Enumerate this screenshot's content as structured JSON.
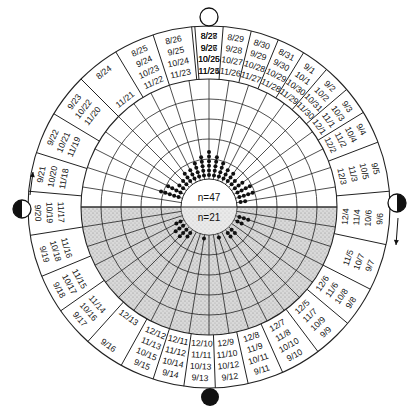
{
  "diagram": {
    "center": {
      "x": 209,
      "y": 207
    },
    "radii": {
      "outer": 181,
      "label_inner": 128,
      "grid": [
        108,
        88,
        68,
        48
      ],
      "core": 28
    },
    "colors": {
      "line": "#222222",
      "shade": "#cfcfcf",
      "dot": "#111111",
      "background": "#ffffff"
    },
    "core_labels": {
      "upper": "n=47",
      "lower": "n=21"
    },
    "moon_symbols": [
      {
        "name": "full-moon-icon",
        "phase": "full",
        "x": 209,
        "y": 17
      },
      {
        "name": "new-moon-icon",
        "phase": "new",
        "x": 210,
        "y": 397
      },
      {
        "name": "first-quarter-moon-icon",
        "phase": "half-right-dark",
        "x": 397,
        "y": 203
      },
      {
        "name": "last-quarter-moon-icon",
        "phase": "half-left-dark",
        "x": 22,
        "y": 209
      }
    ],
    "arrows": [
      {
        "name": "arrow-up-left",
        "x1": 30,
        "y1": 195,
        "x2": 33,
        "y2": 172
      },
      {
        "name": "arrow-down-right",
        "x1": 398,
        "y1": 218,
        "x2": 396,
        "y2": 245
      }
    ],
    "sectors": [
      {
        "angle": -90,
        "lines": [
          "8/28",
          "9/27",
          "10/26",
          "11/25"
        ]
      },
      {
        "angle": -81,
        "lines": [
          "8/29",
          "9/28",
          "10/27",
          "11/26"
        ]
      },
      {
        "angle": -72,
        "lines": [
          "8/30",
          "9/29",
          "10/28",
          "11/27"
        ]
      },
      {
        "angle": -63,
        "lines": [
          "8/31",
          "9/30",
          "10/29",
          "11/28"
        ]
      },
      {
        "angle": -54,
        "lines": [
          "9/1",
          "10/1",
          "10/30",
          "11/29"
        ]
      },
      {
        "angle": -45,
        "lines": [
          "9/2",
          "10/2",
          "10/31",
          "11/30"
        ]
      },
      {
        "angle": -36,
        "lines": [
          "9/3",
          "10/3",
          "11/1",
          "12/1"
        ]
      },
      {
        "angle": -27,
        "lines": [
          "9/4",
          "10/4",
          "11/2",
          "12/2"
        ]
      },
      {
        "angle": -13,
        "lines": [
          "9/5",
          "10/5",
          "11/3",
          "12/3"
        ]
      },
      {
        "angle": 4,
        "lines": [
          "9/6",
          "10/6",
          "11/4",
          "12/4"
        ]
      },
      {
        "angle": 20,
        "lines": [
          "9/7",
          "10/7",
          "11/5"
        ]
      },
      {
        "angle": 34,
        "lines": [
          "9/8",
          "10/8",
          "11/6",
          "12/6"
        ]
      },
      {
        "angle": 47,
        "lines": [
          "9/9",
          "10/9",
          "11/7",
          "12/5"
        ]
      },
      {
        "angle": 60,
        "lines": [
          "9/10",
          "10/10",
          "11/8",
          "12/7"
        ]
      },
      {
        "angle": 72,
        "lines": [
          "9/11",
          "10/11",
          "11/9",
          "12/8"
        ]
      },
      {
        "angle": 83,
        "lines": [
          "9/12",
          "10/12",
          "11/10",
          "12/9"
        ]
      },
      {
        "angle": 93,
        "lines": [
          "9/13",
          "10/13",
          "11/11",
          "12/10"
        ]
      },
      {
        "angle": 103,
        "lines": [
          "9/14",
          "10/14",
          "11/12",
          "12/11"
        ]
      },
      {
        "angle": 113,
        "lines": [
          "9/15",
          "10/15",
          "11/13",
          "12/12"
        ]
      },
      {
        "angle": 126,
        "lines": [
          "9/16",
          "",
          "",
          "12/13"
        ]
      },
      {
        "angle": 139,
        "lines": [
          "9/17",
          "10/16",
          "11/14"
        ]
      },
      {
        "angle": 151,
        "lines": [
          "9/18",
          "10/17",
          "11/15"
        ]
      },
      {
        "angle": 164,
        "lines": [
          "9/19",
          "10/18",
          "11/16"
        ]
      },
      {
        "angle": 178,
        "lines": [
          "9/20",
          "10/19",
          "11/17"
        ]
      },
      {
        "angle": 191,
        "lines": [
          "9/21",
          "10/20",
          "11/18"
        ]
      },
      {
        "angle": 204,
        "lines": [
          "9/22",
          "10/21",
          "11/19"
        ]
      },
      {
        "angle": 218,
        "lines": [
          "9/23",
          "10/22",
          "11/20"
        ]
      },
      {
        "angle": 232,
        "lines": [
          "8/24",
          "",
          "",
          "11/21"
        ]
      },
      {
        "angle": 246,
        "lines": [
          "8/25",
          "9/24",
          "10/23",
          "11/22"
        ]
      },
      {
        "angle": 258,
        "lines": [
          "8/26",
          "9/25",
          "10/24",
          "11/23"
        ]
      },
      {
        "angle": 270,
        "lines": [
          "8/27",
          "9/26",
          "10/25",
          "11/24"
        ]
      }
    ],
    "sector_dividers_deg": [
      -94.5,
      -85.5,
      -76.5,
      -67.5,
      -58.5,
      -49.5,
      -40.5,
      -31.5,
      -21,
      -5,
      12,
      27,
      40,
      53,
      66,
      77.5,
      88,
      98,
      108,
      119,
      132,
      145,
      157.5,
      171,
      185,
      197.5,
      211,
      225,
      239,
      252,
      264.5
    ],
    "grid_spokes_deg": [
      -90,
      -81,
      -72,
      -63,
      -54,
      -45,
      -36,
      -27,
      -18,
      -9,
      0,
      9,
      18,
      27,
      36,
      45,
      54,
      63,
      72,
      81,
      90,
      99,
      108,
      117,
      126,
      135,
      144,
      153,
      162,
      171,
      180,
      189,
      198,
      207,
      216,
      225,
      234,
      243,
      252,
      261
    ],
    "dot_clusters": [
      {
        "angle": -90,
        "count": 6
      },
      {
        "angle": -81,
        "count": 5
      },
      {
        "angle": -99,
        "count": 5
      },
      {
        "angle": -72,
        "count": 4
      },
      {
        "angle": -108,
        "count": 4
      },
      {
        "angle": -63,
        "count": 3
      },
      {
        "angle": -117,
        "count": 3
      },
      {
        "angle": -54,
        "count": 3
      },
      {
        "angle": -126,
        "count": 3
      },
      {
        "angle": -45,
        "count": 2
      },
      {
        "angle": -135,
        "count": 2
      },
      {
        "angle": -36,
        "count": 3
      },
      {
        "angle": -144,
        "count": 2
      },
      {
        "angle": -27,
        "count": 4
      },
      {
        "angle": -153,
        "count": 4
      },
      {
        "angle": -18,
        "count": 4
      },
      {
        "angle": -162,
        "count": 5
      },
      {
        "angle": -9,
        "count": 2
      },
      {
        "angle": 18,
        "count": 3
      },
      {
        "angle": 27,
        "count": 2
      },
      {
        "angle": 45,
        "count": 2
      },
      {
        "angle": 54,
        "count": 2
      },
      {
        "angle": 72,
        "count": 1
      },
      {
        "angle": 99,
        "count": 1
      },
      {
        "angle": 126,
        "count": 2
      },
      {
        "angle": 135,
        "count": 3
      },
      {
        "angle": 144,
        "count": 3
      },
      {
        "angle": 153,
        "count": 2
      }
    ]
  }
}
